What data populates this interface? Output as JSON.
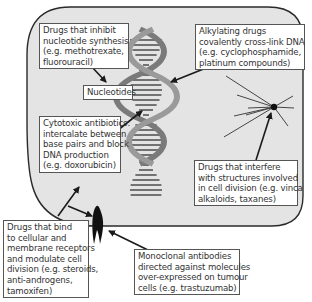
{
  "labels": {
    "nucleotide_synthesis": [
      "Drugs that inhibit",
      "nucleotide synthesis",
      "(e.g. methotrexate,",
      "fluorouracil)"
    ],
    "nucleotides": [
      "Nucleotides"
    ],
    "alkylating": [
      "Alkylating drugs",
      "covalently cross-link DNA",
      "(e.g. cyclophosphamide,",
      "platinum compounds)"
    ],
    "cytotoxic": [
      "Cytotoxic antibiotics:",
      "intercalate between",
      "base pairs and block",
      "DNA production",
      "(e.g. doxorubicin)"
    ],
    "cell_division": [
      "Drugs that interfere",
      "with structures involved",
      "in cell division (e.g. vinca",
      "alkaloids, taxanes)"
    ],
    "receptors": [
      "Drugs that bind",
      "to cellular and",
      "membrane receptors",
      "and modulate cell",
      "division (e.g. steroids,",
      "anti-androgens,",
      "tamoxifen)"
    ],
    "monoclonal": [
      "Monoclonal antibodies",
      "directed against molecules",
      "over-expressed on tumour",
      "cells (e.g. trastuzumab)"
    ]
  },
  "colors": {
    "cell_fill": "#e4e4e4",
    "cell_stroke": "#2a2a2a",
    "helix": "#8a8a8a",
    "arrow": "#1a1a1a"
  }
}
